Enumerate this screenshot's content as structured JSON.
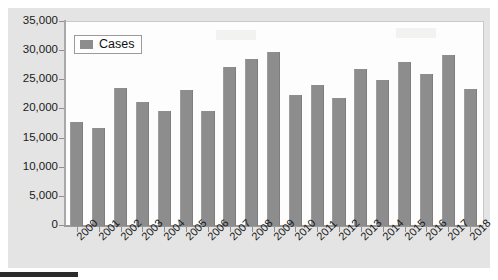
{
  "chart_data": {
    "type": "bar",
    "title": "",
    "subtitle": "",
    "xlabel": "",
    "ylabel": "",
    "legend": [
      "Cases"
    ],
    "legend_position": "top-left-inside",
    "grid": false,
    "ylim": [
      0,
      35000
    ],
    "ytick_labels": [
      "35,000",
      "30,000",
      "25,000",
      "20,000",
      "15,000",
      "10,000",
      "5,000",
      "0"
    ],
    "ytick_values": [
      35000,
      30000,
      25000,
      20000,
      15000,
      10000,
      5000,
      0
    ],
    "categories": [
      "2000",
      "2001",
      "2002",
      "2003",
      "2004",
      "2005",
      "2006",
      "2007",
      "2008",
      "2009",
      "2010",
      "2011",
      "2012",
      "2013",
      "2014",
      "2015",
      "2016",
      "2017",
      "2018"
    ],
    "series": [
      {
        "name": "Cases",
        "color": "#8d8d8d",
        "values": [
          17800,
          16900,
          23700,
          21200,
          19700,
          23300,
          19700,
          27200,
          28700,
          29800,
          22400,
          24200,
          21900,
          27000,
          25100,
          28200,
          26000,
          29400,
          23500
        ]
      }
    ]
  },
  "legend": {
    "label": "Cases",
    "swatch_icon": "legend-square-icon"
  },
  "colors": {
    "bar": "#8d8d8d",
    "plot_background": "#fdfdfd",
    "chart_background": "#e4e4e4",
    "axis": "#9a9a9a",
    "text": "#1a1a1a"
  }
}
